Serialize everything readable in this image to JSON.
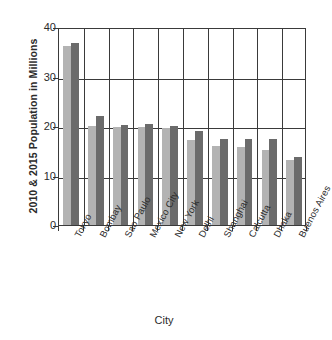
{
  "chart_data": {
    "type": "bar",
    "title": "",
    "xlabel": "City",
    "ylabel": "2010 & 2015 Population in Millions",
    "categories": [
      "Tokyo",
      "Bombay",
      "Sao Paulo",
      "Mexico City",
      "New York",
      "Delhi",
      "Shanghai",
      "Calcutta",
      "Dhaka",
      "Buenos Aires"
    ],
    "series": [
      {
        "name": "2010",
        "color": "#b3b3b3",
        "values": [
          36.2,
          20.0,
          19.8,
          19.8,
          19.5,
          17.2,
          16.0,
          15.7,
          15.1,
          13.2
        ]
      },
      {
        "name": "2015",
        "color": "#6b6b6b",
        "values": [
          36.8,
          22.1,
          20.2,
          20.4,
          20.1,
          18.9,
          17.3,
          17.3,
          17.3,
          13.7
        ]
      }
    ],
    "ylim": [
      0,
      40
    ],
    "yticks": [
      0,
      10,
      20,
      30,
      40
    ],
    "ytick_labels": [
      "0",
      "10",
      "20",
      "30",
      "40"
    ],
    "grid": "both",
    "legend": "none"
  },
  "axis": {
    "y_title": "2010 & 2015 Population in Millions",
    "x_title": "City"
  }
}
